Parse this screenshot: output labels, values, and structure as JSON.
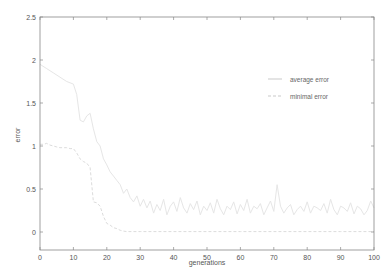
{
  "chart_data": {
    "type": "line",
    "title": "",
    "xlabel": "generations",
    "ylabel": "error",
    "xlim": [
      0,
      100
    ],
    "ylim": [
      -0.2,
      2.5
    ],
    "xticks": [
      0,
      10,
      20,
      30,
      40,
      50,
      60,
      70,
      80,
      90,
      100
    ],
    "yticks": [
      0,
      0.5,
      1,
      1.5,
      2,
      2.5
    ],
    "ytick_labels": [
      "0",
      "0.5",
      "1",
      "1.5",
      "2",
      "2.5"
    ],
    "grid": false,
    "legend_position": "upper right (inside)",
    "series": [
      {
        "name": "average error",
        "style": "solid",
        "color": "#e6e6e6",
        "x": [
          0,
          2,
          4,
          6,
          8,
          10,
          11,
          12,
          13,
          14,
          15,
          16,
          17,
          18,
          19,
          20,
          21,
          22,
          23,
          24,
          25,
          26,
          27,
          28,
          29,
          30,
          31,
          32,
          33,
          34,
          35,
          36,
          37,
          38,
          39,
          40,
          41,
          42,
          43,
          44,
          45,
          46,
          47,
          48,
          49,
          50,
          51,
          52,
          53,
          54,
          55,
          56,
          57,
          58,
          59,
          60,
          61,
          62,
          63,
          64,
          65,
          66,
          67,
          68,
          69,
          70,
          71,
          72,
          73,
          74,
          75,
          76,
          77,
          78,
          79,
          80,
          81,
          82,
          83,
          84,
          85,
          86,
          87,
          88,
          89,
          90,
          91,
          92,
          93,
          94,
          95,
          96,
          97,
          98,
          99,
          100
        ],
        "values": [
          1.95,
          1.9,
          1.85,
          1.8,
          1.75,
          1.72,
          1.6,
          1.3,
          1.28,
          1.35,
          1.38,
          1.2,
          1.05,
          1.0,
          0.85,
          0.78,
          0.7,
          0.65,
          0.6,
          0.55,
          0.45,
          0.5,
          0.4,
          0.35,
          0.42,
          0.3,
          0.38,
          0.28,
          0.36,
          0.22,
          0.32,
          0.25,
          0.38,
          0.2,
          0.3,
          0.35,
          0.24,
          0.4,
          0.28,
          0.22,
          0.33,
          0.26,
          0.36,
          0.2,
          0.3,
          0.25,
          0.34,
          0.22,
          0.38,
          0.27,
          0.2,
          0.3,
          0.26,
          0.35,
          0.21,
          0.32,
          0.25,
          0.38,
          0.22,
          0.3,
          0.27,
          0.33,
          0.2,
          0.28,
          0.36,
          0.24,
          0.55,
          0.3,
          0.22,
          0.28,
          0.32,
          0.2,
          0.26,
          0.3,
          0.24,
          0.35,
          0.22,
          0.3,
          0.28,
          0.25,
          0.33,
          0.22,
          0.38,
          0.26,
          0.2,
          0.3,
          0.28,
          0.24,
          0.34,
          0.21,
          0.3,
          0.27,
          0.2,
          0.25,
          0.36,
          0.28
        ]
      },
      {
        "name": "minimal error",
        "style": "dashed",
        "color": "#dcdcdc",
        "x": [
          0,
          1,
          2,
          3,
          4,
          5,
          6,
          7,
          8,
          9,
          10,
          11,
          12,
          13,
          14,
          15,
          16,
          17,
          18,
          19,
          20,
          21,
          22,
          23,
          24,
          25,
          26,
          30,
          40,
          50,
          60,
          70,
          80,
          90,
          100
        ],
        "values": [
          1.02,
          1.02,
          1.03,
          1.01,
          1.0,
          0.99,
          0.98,
          0.98,
          0.98,
          0.97,
          0.97,
          0.92,
          0.85,
          0.82,
          0.8,
          0.75,
          0.35,
          0.34,
          0.3,
          0.18,
          0.1,
          0.08,
          0.05,
          0.04,
          0.02,
          0.01,
          0.005,
          0.005,
          0.005,
          0.005,
          0.005,
          0.005,
          0.005,
          0.005,
          0.005
        ]
      }
    ]
  },
  "plot": {
    "frame_color": "#888888",
    "text_color": "#555555"
  }
}
